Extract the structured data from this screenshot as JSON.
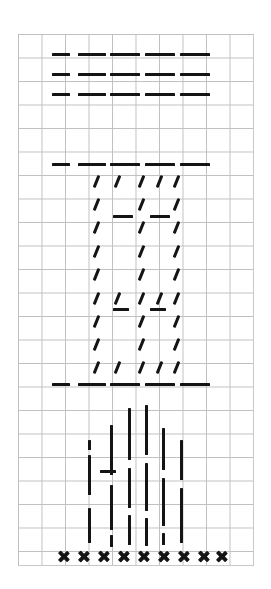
{
  "worksheet": {
    "title": "Penmanship stroke practice sheet",
    "paper": {
      "type": "quadrille-graph-paper",
      "grid_color": "#9a9a9a",
      "ink_color": "#141414",
      "background_color": "#ffffff",
      "cell_size_px": 23.5,
      "origin_x_px": 18,
      "origin_y_px": 34,
      "columns": 10,
      "rows": 22
    },
    "bands": [
      {
        "id": "band-horizontal-dashes",
        "label": "Horizontal dash rows",
        "stroke_type": "horizontal-dash",
        "rows": 3,
        "marks_per_row": 5,
        "row_y_px": [
          53,
          73,
          93
        ],
        "dash_x_px": [
          52,
          78,
          110,
          145,
          180
        ],
        "dash_w_px": [
          18,
          28,
          30,
          30,
          30
        ]
      },
      {
        "id": "band-slash-box",
        "label": "Diagonal slash box",
        "stroke_type": "diagonal-slash",
        "top_rule_y_px": 163,
        "bottom_rule_y_px": 383,
        "rule_x_px": [
          52,
          78,
          110,
          145,
          180
        ],
        "rule_w_px": [
          18,
          28,
          30,
          30,
          30
        ],
        "slash_columns_x_px": [
          95,
          140,
          175
        ],
        "slash_rows_y_px": [
          175,
          198,
          221,
          245,
          268,
          292,
          315,
          338,
          361
        ],
        "slash_row_full_y_px": [
          175,
          292,
          361
        ],
        "slash_row_full_x_px": [
          95,
          116,
          140,
          158,
          175
        ],
        "inner_dashes": [
          {
            "x": 113,
            "y": 215,
            "w": 20
          },
          {
            "x": 150,
            "y": 215,
            "w": 20
          },
          {
            "x": 113,
            "y": 308,
            "w": 16
          },
          {
            "x": 150,
            "y": 308,
            "w": 16
          }
        ]
      },
      {
        "id": "band-vertical-strokes",
        "label": "Vertical stroke cluster",
        "stroke_type": "vertical-bar",
        "columns_x_px": [
          88,
          110,
          128,
          145,
          162,
          180
        ],
        "single_dash": {
          "x": 100,
          "y": 470,
          "w": 16
        },
        "bars": [
          {
            "x": 88,
            "y": 440,
            "h": 10
          },
          {
            "x": 88,
            "y": 455,
            "h": 40
          },
          {
            "x": 88,
            "y": 508,
            "h": 35
          },
          {
            "x": 110,
            "y": 425,
            "h": 50
          },
          {
            "x": 110,
            "y": 485,
            "h": 45
          },
          {
            "x": 110,
            "y": 535,
            "h": 12
          },
          {
            "x": 128,
            "y": 408,
            "h": 52
          },
          {
            "x": 128,
            "y": 468,
            "h": 40
          },
          {
            "x": 128,
            "y": 515,
            "h": 30
          },
          {
            "x": 145,
            "y": 405,
            "h": 50
          },
          {
            "x": 145,
            "y": 463,
            "h": 48
          },
          {
            "x": 145,
            "y": 518,
            "h": 28
          },
          {
            "x": 162,
            "y": 428,
            "h": 42
          },
          {
            "x": 162,
            "y": 478,
            "h": 48
          },
          {
            "x": 162,
            "y": 533,
            "h": 12
          },
          {
            "x": 180,
            "y": 440,
            "h": 40
          },
          {
            "x": 180,
            "y": 488,
            "h": 55
          }
        ]
      },
      {
        "id": "band-x-marks",
        "label": "X mark baseline row",
        "stroke_type": "x-mark",
        "count": 9,
        "y_px": 550,
        "x_px": [
          57,
          77,
          97,
          117,
          137,
          157,
          177,
          197,
          215
        ],
        "glyph": "✕"
      }
    ]
  }
}
